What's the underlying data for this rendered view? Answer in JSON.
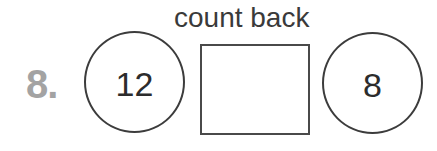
{
  "question": {
    "number": "8.",
    "instruction": "count back",
    "start_value": "12",
    "answer_value": "",
    "end_value": "8"
  },
  "colors": {
    "number_label": "#a3a3a3",
    "outline": "#3c3c3c",
    "text": "#2c2c2c"
  }
}
